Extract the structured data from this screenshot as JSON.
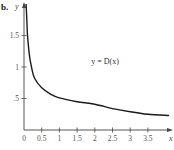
{
  "part_label": "b.",
  "chart_data": {
    "type": "line",
    "title": "",
    "xlabel": "x",
    "ylabel": "y",
    "x_ticks": [
      "0",
      "0.5",
      "1",
      "1.5",
      "2",
      "2.5",
      "3",
      "3.5"
    ],
    "x_tick_values": [
      0,
      0.5,
      1,
      1.5,
      2,
      2.5,
      3,
      3.5
    ],
    "y_ticks": [
      ".5",
      "1",
      "1.5"
    ],
    "y_tick_values": [
      0.5,
      1,
      1.5
    ],
    "xlim": [
      0,
      4.1
    ],
    "ylim": [
      0,
      2.0
    ],
    "grid": false,
    "legend": null,
    "annotations": [
      {
        "text": "y = D(x)",
        "x": 1.9,
        "y": 1.05
      }
    ],
    "series": [
      {
        "name": "y = D(x)",
        "color": "#1a1a1a",
        "x": [
          0.06,
          0.08,
          0.1,
          0.15,
          0.2,
          0.3,
          0.5,
          0.75,
          1.0,
          1.5,
          2.0,
          2.5,
          3.0,
          3.5,
          4.1
        ],
        "y": [
          2.0,
          1.75,
          1.5,
          1.2,
          1.03,
          0.82,
          0.67,
          0.57,
          0.51,
          0.45,
          0.41,
          0.34,
          0.29,
          0.25,
          0.23
        ]
      }
    ]
  },
  "colors": {
    "axis": "#444444",
    "curve": "#1a1a1a",
    "text": "#555555"
  }
}
